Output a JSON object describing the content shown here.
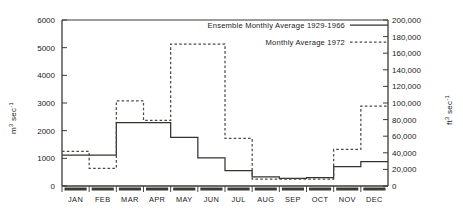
{
  "chart_data": {
    "type": "line",
    "subtype": "step",
    "title": "",
    "xlabel": "",
    "ylabel": "m3 sec-1",
    "ylabel_secondary": "ft3 sec-1",
    "categories": [
      "JAN",
      "FEB",
      "MAR",
      "APR",
      "MAY",
      "JUN",
      "JUL",
      "AUG",
      "SEP",
      "OCT",
      "NOV",
      "DEC"
    ],
    "ylim": [
      0,
      6000
    ],
    "yticks": [
      0,
      1000,
      2000,
      3000,
      4000,
      5000,
      6000
    ],
    "ytick_labels": [
      "0",
      "1000",
      "2000",
      "3000",
      "4000",
      "5000",
      "6000"
    ],
    "ylim_secondary": [
      0,
      200000
    ],
    "yticks_secondary": [
      0,
      20000,
      40000,
      60000,
      80000,
      100000,
      120000,
      140000,
      160000,
      180000,
      200000
    ],
    "ytick_labels_secondary": [
      "0",
      "20,000",
      "40,000",
      "60,000",
      "80,000",
      "100,000",
      "120,000",
      "140,000",
      "160,000",
      "180,000",
      "200,000"
    ],
    "grid": false,
    "legend_position": "top-right",
    "series": [
      {
        "name": "Ensemble Monthly Average 1929-1966",
        "style": "solid",
        "color": "#33332e",
        "values": [
          1120,
          1120,
          2290,
          2290,
          1760,
          1020,
          560,
          330,
          280,
          300,
          700,
          880
        ]
      },
      {
        "name": "Monthly Average 1972",
        "style": "dashed",
        "color": "#4a4a45",
        "values": [
          1250,
          640,
          3080,
          2370,
          5130,
          5130,
          1720,
          250,
          250,
          250,
          1320,
          2890
        ]
      }
    ]
  },
  "axes": {
    "left_title_main": "m",
    "left_title_sup": "3",
    "left_title_unit": "sec",
    "left_title_unit_sup": "-1",
    "right_title_main": "ft",
    "right_title_sup": "3",
    "right_title_unit": "sec",
    "right_title_unit_sup": "-1"
  },
  "legend": {
    "entries": [
      {
        "label": "Ensemble Monthly Average 1929-1966",
        "style": "solid"
      },
      {
        "label": "Monthly Average 1972",
        "style": "dashed"
      }
    ]
  }
}
